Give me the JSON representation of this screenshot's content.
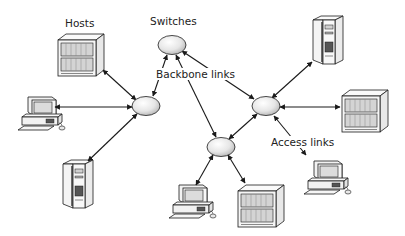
{
  "diagram": {
    "type": "network-topology",
    "labels": {
      "hosts": "Hosts",
      "switches": "Switches",
      "backbone_links": "Backbone links",
      "access_links": "Access links"
    },
    "colors": {
      "stroke": "#1a1a1a",
      "switch_fill_light": "#f4f4f4",
      "switch_fill_dark": "#bdbdbd",
      "device_fill": "#f2f2f2",
      "device_panel": "#d9d9d9"
    },
    "switches": [
      {
        "id": "S1",
        "position": "top"
      },
      {
        "id": "S2",
        "position": "left"
      },
      {
        "id": "S3",
        "position": "right"
      },
      {
        "id": "S4",
        "position": "bottom"
      }
    ],
    "hosts": [
      {
        "id": "H1",
        "kind": "server-cabinet",
        "attached_to": "S2"
      },
      {
        "id": "H2",
        "kind": "desktop-pc",
        "attached_to": "S2"
      },
      {
        "id": "H3",
        "kind": "tower-server",
        "attached_to": "S2"
      },
      {
        "id": "H4",
        "kind": "tower-server",
        "attached_to": "S3"
      },
      {
        "id": "H5",
        "kind": "server-cabinet",
        "attached_to": "S3"
      },
      {
        "id": "H6",
        "kind": "desktop-pc",
        "attached_to": "S3"
      },
      {
        "id": "H7",
        "kind": "desktop-pc",
        "attached_to": "S4"
      },
      {
        "id": "H8",
        "kind": "server-cabinet",
        "attached_to": "S4"
      }
    ],
    "backbone_links": [
      {
        "from": "S1",
        "to": "S2"
      },
      {
        "from": "S1",
        "to": "S3"
      },
      {
        "from": "S1",
        "to": "S4"
      },
      {
        "from": "S3",
        "to": "S4"
      }
    ]
  }
}
